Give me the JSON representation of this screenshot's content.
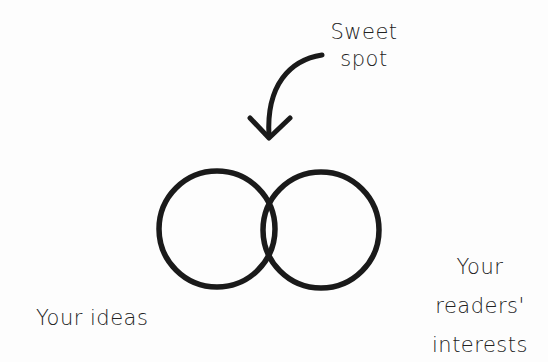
{
  "diagram": {
    "type": "venn",
    "annotation": {
      "lines": [
        "Sweet",
        "spot"
      ],
      "points_to": "intersection"
    },
    "sets": [
      {
        "id": "left",
        "label_lines": [
          "Your ideas"
        ]
      },
      {
        "id": "right",
        "label_lines": [
          "Your",
          "readers'",
          "interests"
        ]
      }
    ],
    "stroke_color": "#1a1a1a",
    "background_color": "#fdfdfd"
  }
}
